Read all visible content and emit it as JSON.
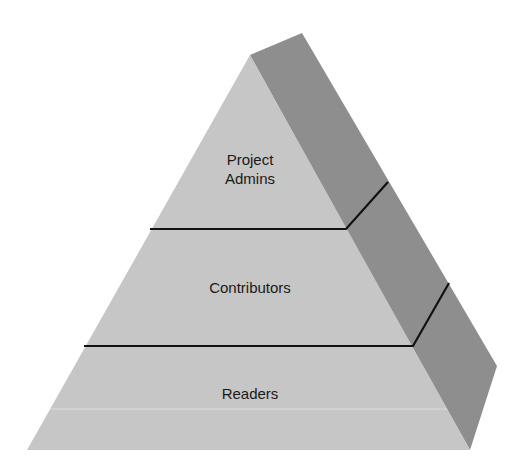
{
  "diagram": {
    "type": "pyramid",
    "colors": {
      "front_face": "#c4c4c4",
      "side_face": "#8c8c8c",
      "divider": "#111111",
      "background": "#ffffff"
    },
    "tiers": [
      {
        "label_line1": "Project",
        "label_line2": "Admins"
      },
      {
        "label": "Contributors"
      },
      {
        "label": "Readers"
      }
    ]
  }
}
